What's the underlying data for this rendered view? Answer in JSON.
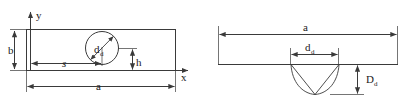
{
  "figure": {
    "stroke_color": "#3a3a3a",
    "text_color": "#1a1a1a",
    "background": "#ffffff"
  },
  "left_view": {
    "name": "plate-plan-view",
    "axes": {
      "y_label": "y",
      "x_label": "x"
    },
    "labels": {
      "height": "b",
      "length": "a",
      "offset": "s",
      "vertical_offset": "h",
      "dent_diameter": "d",
      "dent_diameter_subscript": "d"
    }
  },
  "right_view": {
    "name": "dent-section-view",
    "labels": {
      "length": "a",
      "dent_diameter": "d",
      "dent_diameter_subscript": "d",
      "dent_depth": "D",
      "dent_depth_subscript": "d"
    }
  }
}
